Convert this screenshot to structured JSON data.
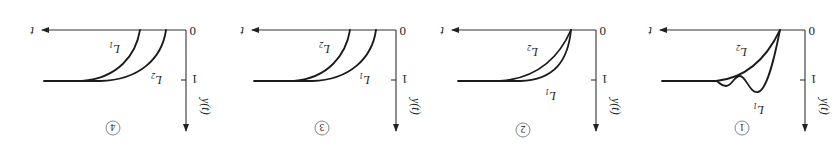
{
  "figure": {
    "orientation": "rotated-180",
    "panels": [
      {
        "id": "1",
        "circled_label": "1",
        "origin_label": "0",
        "tick_label": "1",
        "x_axis_label": "t",
        "y_axis_label": "y(t)",
        "curve_labels": [
          "L1",
          "L2"
        ],
        "description": "L1 oscillates (overshoot with decaying bumps) before settling to 1; L2 rises monotonically to 1; both start at same time"
      },
      {
        "id": "2",
        "circled_label": "2",
        "origin_label": "0",
        "tick_label": "1",
        "x_axis_label": "t",
        "y_axis_label": "y(t)",
        "curve_labels": [
          "L1",
          "L2"
        ],
        "description": "Both start at same delay; L1 rises faster than L2, both settle to 1"
      },
      {
        "id": "3",
        "circled_label": "3",
        "origin_label": "0",
        "tick_label": "1",
        "x_axis_label": "t",
        "y_axis_label": "y(t)",
        "curve_labels": [
          "L1",
          "L2"
        ],
        "description": "L1 starts earlier (smaller delay) than L2; both rise monotonically to 1"
      },
      {
        "id": "4",
        "circled_label": "4",
        "origin_label": "0",
        "tick_label": "1",
        "x_axis_label": "t",
        "y_axis_label": "y(t)",
        "curve_labels": [
          "L1",
          "L2"
        ],
        "description": "L2 starts earlier than L1; both rise monotonically to 1"
      }
    ]
  }
}
